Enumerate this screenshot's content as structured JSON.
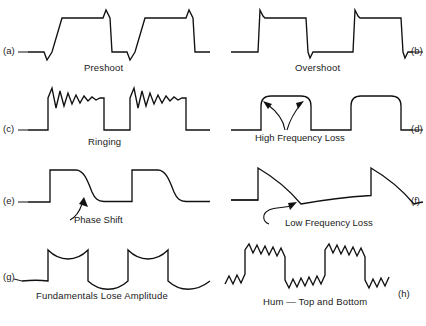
{
  "figure": {
    "title_visible": false,
    "background_color": "#ffffff",
    "line_color": "#111111",
    "panel_count": 8
  },
  "panels": [
    {
      "id": "a",
      "letter": "(a)",
      "caption": "Preshoot",
      "distortion": "preshoot",
      "description": "square wave with slanted rising edges and downward spikes preceding transitions"
    },
    {
      "id": "b",
      "letter": "(b)",
      "caption": "Overshoot",
      "distortion": "overshoot",
      "description": "square wave with spikes overshooting past each corner"
    },
    {
      "id": "c",
      "letter": "(c)",
      "caption": "Ringing",
      "distortion": "ringing",
      "description": "square wave with damped oscillation along each flat top"
    },
    {
      "id": "d",
      "letter": "(d)",
      "caption": "High Frequency Loss",
      "distortion": "high-frequency-loss",
      "description": "square wave with rounded corners, two arrows pointing to rounded tops"
    },
    {
      "id": "e",
      "letter": "(e)",
      "caption": "Phase Shift",
      "distortion": "phase-shift",
      "description": "square wave with exponential decay on falling edges"
    },
    {
      "id": "f",
      "letter": "(f)",
      "caption": "Low Frequency Loss",
      "distortion": "low-frequency-loss",
      "description": "square wave with pronounced tilt and sag, curved arrow to trough"
    },
    {
      "id": "g",
      "letter": "(g)",
      "caption": "Fundamentals Lose Amplitude",
      "distortion": "fundamentals-lose-amplitude",
      "description": "square wave with concave sagging tops and bottoms"
    },
    {
      "id": "h",
      "letter": "(h)",
      "caption": "Hum — Top and Bottom",
      "distortion": "hum",
      "description": "square wave with sinusoidal ripple riding on both high and low levels"
    }
  ]
}
